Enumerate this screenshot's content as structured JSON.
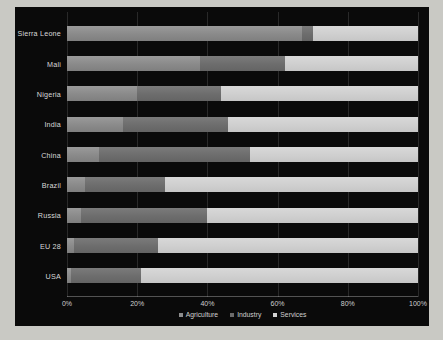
{
  "chart_data": {
    "type": "bar",
    "orientation": "horizontal",
    "stacked": true,
    "normalized": true,
    "title": "",
    "xlabel": "",
    "ylabel": "",
    "xlim": [
      0,
      100
    ],
    "grid": true,
    "legend_position": "bottom",
    "xticks": [
      "0%",
      "20%",
      "40%",
      "60%",
      "80%",
      "100%"
    ],
    "xtick_values": [
      0,
      20,
      40,
      60,
      80,
      100
    ],
    "categories": [
      "Sierra Leone",
      "Mali",
      "Nigeria",
      "India",
      "China",
      "Brazil",
      "Russia",
      "EU 28",
      "USA"
    ],
    "series": [
      {
        "name": "Agriculture",
        "color": "#8d8d8d",
        "values": [
          67,
          38,
          20,
          16,
          9,
          5,
          4,
          2,
          1
        ]
      },
      {
        "name": "Industry",
        "color": "#6b6b6b",
        "values": [
          3,
          24,
          24,
          30,
          43,
          23,
          36,
          24,
          20
        ]
      },
      {
        "name": "Services",
        "color": "#d2d2d2",
        "values": [
          30,
          38,
          56,
          54,
          48,
          72,
          60,
          74,
          79
        ]
      }
    ]
  },
  "legend": {
    "items": [
      {
        "label": "Agriculture",
        "swatch": "legend-swatch-agriculture"
      },
      {
        "label": "Industry",
        "swatch": "legend-swatch-industry"
      },
      {
        "label": "Services",
        "swatch": "legend-swatch-services"
      }
    ]
  },
  "colors": {
    "background": "#c9c9c4",
    "panel": "#0a0a0a",
    "text": "#d9d9d9",
    "agriculture": "#8d8d8d",
    "industry": "#6b6b6b",
    "services": "#d2d2d2"
  }
}
